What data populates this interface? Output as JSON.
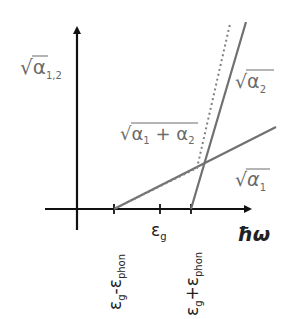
{
  "diagram": {
    "y_axis_label": {
      "root": "√",
      "base": "α",
      "sub": "1,2"
    },
    "x_axis_label": "ħω",
    "curves": [
      {
        "id": "sqrt-alpha1",
        "label_root": "√",
        "label_base": "α",
        "label_sub": "1",
        "style": "solid"
      },
      {
        "id": "sqrt-alpha2",
        "label_root": "√",
        "label_base": "α",
        "label_sub": "2",
        "style": "solid"
      },
      {
        "id": "sqrt-alpha1-plus-alpha2",
        "label_root": "√",
        "label_base": "α",
        "label_sub_a": "1",
        "label_plus": " + ",
        "label_base_b": "α",
        "label_sub_b": "2",
        "style": "dotted"
      }
    ],
    "x_ticks": [
      {
        "main": "ε",
        "sub": "g",
        "suffix_op": "-",
        "suffix_main": "ε",
        "suffix_sub": "phon"
      },
      {
        "main": "ε",
        "sub": "g"
      },
      {
        "main": "ε",
        "sub": "g",
        "suffix_op": "+",
        "suffix_main": "ε",
        "suffix_sub": "phon"
      }
    ],
    "colors": {
      "axis": "#111111",
      "curve": "#707070",
      "label": "#6a6a6a"
    }
  }
}
